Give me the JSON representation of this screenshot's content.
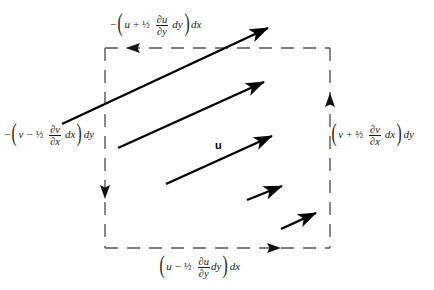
{
  "figure": {
    "type": "vector-field-control-volume-diagram",
    "background_color": "#ffffff",
    "line_color": "#1a1a1a",
    "arrow_color": "#000000"
  },
  "control_volume": {
    "name": "dashed-control-volume",
    "shape": "rectangle",
    "stroke_style": "dashed",
    "x": 105,
    "y": 48,
    "width": 225,
    "height": 200,
    "circulation_sense": "counterclockwise"
  },
  "edge_labels": {
    "top": {
      "sign": "−",
      "open_paren": "(",
      "base_symbol": "u",
      "operator": "+",
      "coefficient": "½",
      "derivative_numerator": "∂u",
      "derivative_denominator": "∂y",
      "differential_inner": "dy",
      "close_paren": ")",
      "differential_outer": "dx",
      "plain": "−(u + ½ ∂u/∂y dy)dx"
    },
    "left": {
      "sign": "−",
      "open_paren": "(",
      "base_symbol": "v",
      "operator": "−",
      "coefficient": "½",
      "derivative_numerator": "∂v",
      "derivative_denominator": "∂x",
      "differential_inner": "dx",
      "close_paren": ")",
      "differential_outer": "dy",
      "plain": "−(v − ½ ∂v/∂x dx)dy"
    },
    "right": {
      "sign": "",
      "open_paren": "(",
      "base_symbol": "v",
      "operator": "+",
      "coefficient": "½",
      "derivative_numerator": "∂v",
      "derivative_denominator": "∂x",
      "differential_inner": "dx",
      "close_paren": ")",
      "differential_outer": "dy",
      "plain": "(v + ½ ∂v/∂x dx)dy"
    },
    "bottom": {
      "sign": "",
      "open_paren": "(",
      "base_symbol": "u",
      "operator": "−",
      "coefficient": "½",
      "derivative_numerator": "∂u",
      "derivative_denominator": "∂y",
      "differential_inner": "dy",
      "close_paren": ")",
      "differential_outer": "dx",
      "plain": "(u − ½ ∂u/∂y dy)dx"
    }
  },
  "velocity_label": {
    "text": "u",
    "x": 215,
    "y": 139
  },
  "circulation_arrowheads": [
    {
      "name": "top-edge-arrowhead",
      "direction": "left",
      "x": 133,
      "y": 48
    },
    {
      "name": "left-edge-arrowhead",
      "direction": "down",
      "x": 105,
      "y": 192
    },
    {
      "name": "bottom-edge-arrowhead",
      "direction": "right",
      "x": 274,
      "y": 248
    },
    {
      "name": "right-edge-arrowhead",
      "direction": "up",
      "x": 330,
      "y": 100
    }
  ],
  "velocity_arrows": [
    {
      "name": "velocity-arrow-1",
      "x1": 62,
      "y1": 124,
      "x2": 274,
      "y2": 25
    },
    {
      "name": "velocity-arrow-2",
      "x1": 118,
      "y1": 148,
      "x2": 270,
      "y2": 79
    },
    {
      "name": "velocity-arrow-3",
      "x1": 166,
      "y1": 184,
      "x2": 278,
      "y2": 133
    },
    {
      "name": "velocity-arrow-4",
      "x1": 247,
      "y1": 200,
      "x2": 287,
      "y2": 184
    },
    {
      "name": "velocity-arrow-5",
      "x1": 281,
      "y1": 229,
      "x2": 321,
      "y2": 211
    }
  ]
}
